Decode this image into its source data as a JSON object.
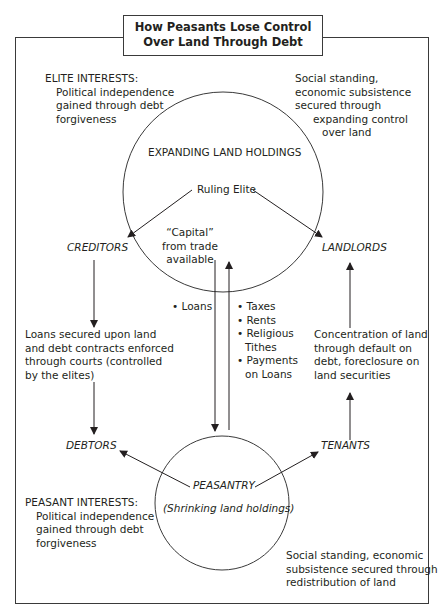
{
  "title": {
    "line1": "How Peasants Lose Control",
    "line2": "Over Land Through Debt"
  },
  "elite_interests": {
    "heading": "ELITE INTERESTS:",
    "lines": [
      "Political independence",
      "gained through debt",
      "forgiveness"
    ]
  },
  "elite_right_note": {
    "lines": [
      "Social standing,",
      "economic subsistence",
      "secured through",
      "expanding control",
      "over land"
    ]
  },
  "top_circle": {
    "label": "EXPANDING LAND HOLDINGS",
    "center_label": "Ruling Elite",
    "capital_lines": [
      "“Capital”",
      "from trade",
      "available"
    ]
  },
  "nodes": {
    "creditors": "CREDITORS",
    "landlords": "LANDLORDS",
    "debtors": "DEBTORS",
    "tenants": "TENANTS"
  },
  "flows": {
    "down_label": "• Loans",
    "up_items": [
      "• Taxes",
      "• Rents",
      "• Religious",
      "Tithes",
      "• Payments",
      "on Loans"
    ]
  },
  "left_middle_note": {
    "lines": [
      "Loans secured upon land",
      "and debt contracts enforced",
      "through courts (controlled",
      "by the elites)"
    ]
  },
  "right_middle_note": {
    "lines": [
      "Concentration of land",
      "through default on",
      "debt, foreclosure on",
      "land securities"
    ]
  },
  "bottom_circle": {
    "label": "PEASANTRY",
    "sublabel": "(Shrinking land holdings)"
  },
  "peasant_interests": {
    "heading": "PEASANT INTERESTS:",
    "lines": [
      "Political independence",
      "gained through debt",
      "forgiveness"
    ]
  },
  "peasant_right_note": {
    "lines": [
      "Social standing, economic",
      "subsistence secured through",
      "redistribution of land"
    ]
  },
  "colors": {
    "line": "#3a3a3a",
    "text": "#231f20",
    "background": "#ffffff"
  }
}
